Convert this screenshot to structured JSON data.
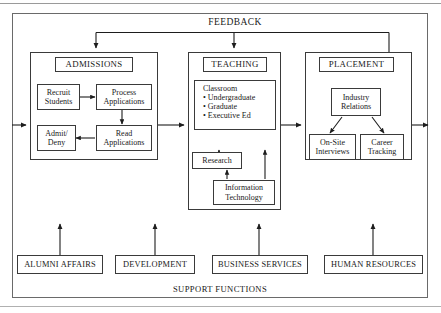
{
  "diagram": {
    "title_top": "FEEDBACK",
    "title_bottom": "SUPPORT FUNCTIONS",
    "groups": [
      {
        "id": "admissions",
        "label": "ADMISSIONS"
      },
      {
        "id": "teaching",
        "label": "TEACHING"
      },
      {
        "id": "placement",
        "label": "PLACEMENT"
      }
    ],
    "admissions": {
      "header": "ADMISSIONS",
      "nodes": [
        {
          "id": "recruit-students",
          "line1": "Recruit",
          "line2": "Students"
        },
        {
          "id": "process-applications",
          "line1": "Process",
          "line2": "Applications"
        },
        {
          "id": "read-applications",
          "line1": "Read",
          "line2": "Applications"
        },
        {
          "id": "admit-deny",
          "line1": "Admit/",
          "line2": "Deny"
        }
      ]
    },
    "teaching": {
      "header": "TEACHING",
      "classroom": {
        "heading": "Classroom",
        "items": [
          "Undergraduate",
          "Graduate",
          "Executive Ed"
        ],
        "bullet": "•"
      },
      "nodes": [
        {
          "id": "research",
          "line1": "Research",
          "line2": ""
        },
        {
          "id": "information-technology",
          "line1": "Information",
          "line2": "Technology"
        }
      ]
    },
    "placement": {
      "header": "PLACEMENT",
      "nodes": [
        {
          "id": "industry-relations",
          "line1": "Industry",
          "line2": "Relations"
        },
        {
          "id": "on-site-interviews",
          "line1": "On-Site",
          "line2": "Interviews"
        },
        {
          "id": "career-tracking",
          "line1": "Career",
          "line2": "Tracking"
        }
      ]
    },
    "support_functions": [
      {
        "id": "alumni-affairs",
        "label": "ALUMNI AFFAIRS"
      },
      {
        "id": "development",
        "label": "DEVELOPMENT"
      },
      {
        "id": "business-services",
        "label": "BUSINESS SERVICES"
      },
      {
        "id": "human-resources",
        "label": "HUMAN RESOURCES"
      }
    ],
    "colors": {
      "stroke": "#3a3a3a",
      "outer_stroke": "#6a6a6a",
      "text": "#191919",
      "background": "#ffffff"
    }
  }
}
